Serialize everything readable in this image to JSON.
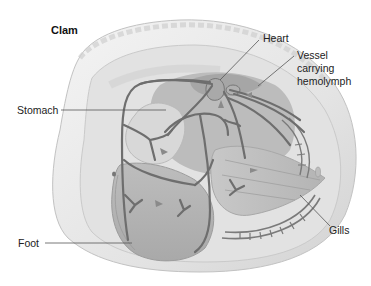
{
  "diagram": {
    "title": "Clam",
    "labels": {
      "heart": "Heart",
      "vessel_line1": "Vessel",
      "vessel_line2": "carrying",
      "vessel_line3": "hemolymph",
      "stomach": "Stomach",
      "foot": "Foot",
      "gills": "Gills"
    },
    "colors": {
      "background": "#ffffff",
      "shell_light": "#ececec",
      "shell_mid": "#d6d6d6",
      "body_mid": "#b8b8b8",
      "body_dark": "#a3a3a3",
      "vessel": "#6e6e6e",
      "leader_line": "#555555",
      "text": "#222222"
    }
  }
}
